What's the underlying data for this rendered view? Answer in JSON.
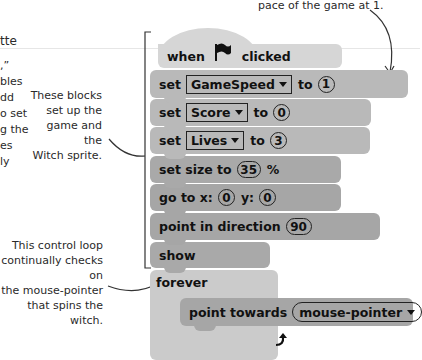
{
  "annotations": {
    "top_right": "pace of the game at 1.",
    "left_partial_heading": "tte",
    "left_partial_lines": [
      ",”",
      "bles",
      "dd",
      "o set",
      "g the",
      "es",
      "ly"
    ],
    "setup_note": [
      "These blocks",
      "set up the",
      "game and the",
      "Witch sprite."
    ],
    "loop_note": [
      "This control loop",
      "continually checks on",
      "the mouse-pointer",
      "that spins the witch."
    ]
  },
  "script": {
    "hat": {
      "when": "when",
      "icon": "green-flag-icon",
      "clicked": "clicked"
    },
    "set_gamespeed": {
      "set": "set",
      "variable": "GameSpeed",
      "to": "to",
      "value": "1"
    },
    "set_score": {
      "set": "set",
      "variable": "Score",
      "to": "to",
      "value": "0"
    },
    "set_lives": {
      "set": "set",
      "variable": "Lives",
      "to": "to",
      "value": "3"
    },
    "set_size": {
      "label": "set size to",
      "value": "35",
      "unit": "%"
    },
    "go_to": {
      "label": "go to x:",
      "x": "0",
      "ylabel": "y:",
      "y": "0"
    },
    "point_direction": {
      "label": "point in direction",
      "value": "90"
    },
    "show": {
      "label": "show"
    },
    "forever": {
      "label": "forever",
      "loop_icon": "loop-arrow-icon"
    },
    "point_towards": {
      "label": "point towards",
      "target": "mouse-pointer"
    }
  },
  "colors": {
    "hat": "#d6d6d6",
    "variables": "#b9b9b9",
    "motion": "#a6a6a6",
    "looks": "#a9a9a9",
    "control": "#cbcbcb"
  }
}
